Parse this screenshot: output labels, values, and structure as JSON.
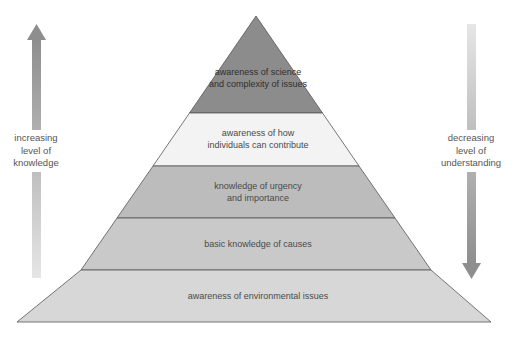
{
  "diagram": {
    "type": "pyramid",
    "levels": [
      {
        "label_line1": "awareness of science",
        "label_line2": "and complexity of issues",
        "color": "#8c8c8c"
      },
      {
        "label_line1": "awareness of how",
        "label_line2": "individuals can contribute",
        "color": "#f2f2f2"
      },
      {
        "label_line1": "knowledge of urgency",
        "label_line2": "and importance",
        "color": "#bdbdbd"
      },
      {
        "label_line1": "basic knowledge of causes",
        "label_line2": "",
        "color": "#c8c8c8"
      },
      {
        "label_line1": "awareness of environmental issues",
        "label_line2": "",
        "color": "#d6d6d6"
      }
    ],
    "left_arrow": {
      "direction": "up",
      "line1": "increasing",
      "line2": "level of",
      "line3": "knowledge"
    },
    "right_arrow": {
      "direction": "down",
      "line1": "decreasing",
      "line2": "level of",
      "line3": "understanding"
    }
  }
}
